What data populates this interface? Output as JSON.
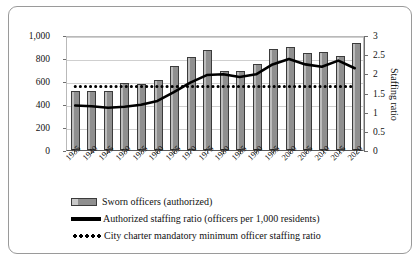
{
  "chart_data": {
    "type": "bar",
    "title": "",
    "xlabel": "",
    "ylabel": "",
    "grid": true,
    "legend_position": "bottom",
    "categories": [
      "1935",
      "1940",
      "1945",
      "1950",
      "1955",
      "1960",
      "1965",
      "1970",
      "1975",
      "1980",
      "1985",
      "1990",
      "1995",
      "2000",
      "2005",
      "2010",
      "2015",
      "2020"
    ],
    "yticks": [
      "0",
      "200",
      "400",
      "600",
      "800",
      "1,000"
    ],
    "ylim": [
      0,
      1000
    ],
    "y2ticks": [
      "0",
      "0.5",
      "1",
      "1.5",
      "2",
      "2.5",
      "3"
    ],
    "y2lim": [
      0,
      3
    ],
    "y2label": "Staffing ratio",
    "series": [
      {
        "name": "Sworn officers (authorized)",
        "type": "bar",
        "axis": "left",
        "values": [
          510,
          510,
          510,
          580,
          575,
          610,
          730,
          810,
          870,
          690,
          690,
          745,
          880,
          900,
          840,
          850,
          815,
          930
        ]
      },
      {
        "name": "Authorized staffing ratio (officers per 1,000 residents)",
        "type": "line",
        "axis": "right",
        "values": [
          1.2,
          1.18,
          1.14,
          1.17,
          1.22,
          1.32,
          1.55,
          1.8,
          2.0,
          2.02,
          1.95,
          2.02,
          2.28,
          2.42,
          2.28,
          2.22,
          2.38,
          2.18
        ]
      },
      {
        "name": "City charter mandatory minimum officer staffing ratio",
        "type": "line",
        "axis": "right",
        "style": "dotted",
        "constant": 1.7
      }
    ]
  },
  "legend": {
    "items": [
      {
        "label": "Sworn officers (authorized)",
        "marker": "bar-swatch"
      },
      {
        "label": "Authorized staffing ratio (officers per 1,000 residents)",
        "marker": "solid-line-swatch"
      },
      {
        "label": "City charter mandatory minimum officer staffing ratio",
        "marker": "dotted-line-swatch"
      }
    ]
  }
}
